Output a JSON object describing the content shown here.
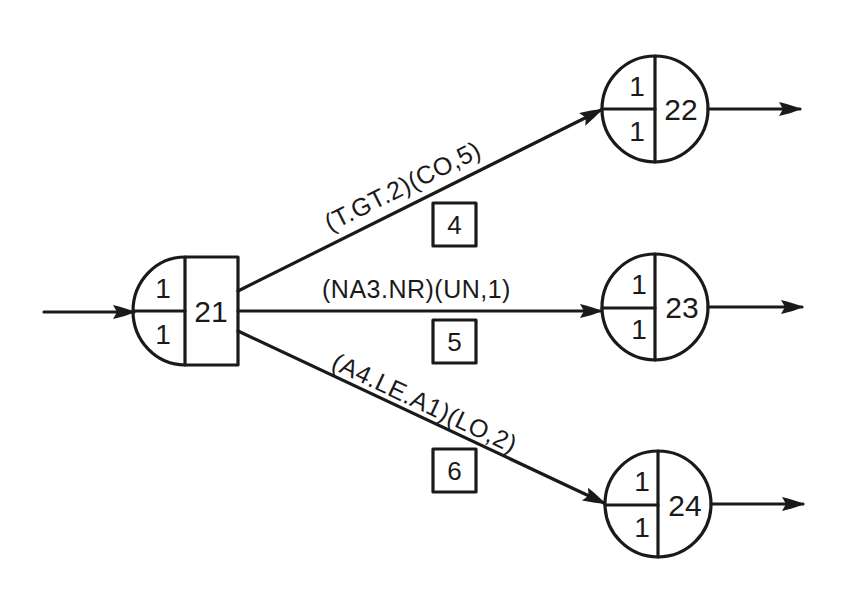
{
  "diagram": {
    "type": "flow-network",
    "source_node": {
      "id": "21",
      "top_value": "1",
      "bottom_value": "1",
      "shape": "half-circle-with-box"
    },
    "target_nodes": [
      {
        "id": "22",
        "top_value": "1",
        "bottom_value": "1",
        "shape": "split-circle"
      },
      {
        "id": "23",
        "top_value": "1",
        "bottom_value": "1",
        "shape": "split-circle"
      },
      {
        "id": "24",
        "top_value": "1",
        "bottom_value": "1",
        "shape": "split-circle"
      }
    ],
    "edges": [
      {
        "from": "21",
        "to": "22",
        "label": "(T.GT.2)(CO,5)",
        "box_number": "4"
      },
      {
        "from": "21",
        "to": "23",
        "label": "(NA3.NR)(UN,1)",
        "box_number": "5"
      },
      {
        "from": "21",
        "to": "24",
        "label": "(A4.LE.A1)(LO,2)",
        "box_number": "6"
      }
    ],
    "colors": {
      "line": "#1a1a1a",
      "background": "#ffffff"
    }
  }
}
